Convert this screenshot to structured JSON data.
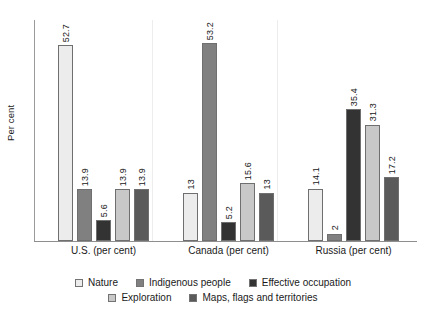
{
  "chart_data": {
    "type": "bar",
    "title": "",
    "subtitle": "",
    "xlabel": "",
    "ylabel": "Per cent",
    "ylim": [
      0,
      60
    ],
    "grid": false,
    "legend_position": "bottom",
    "orientation": "vertical",
    "grouping": "grouped",
    "value_labels_rotated": true,
    "categories": [
      "U.S. (per cent)",
      "Canada (per cent)",
      "Russia (per cent)"
    ],
    "series": [
      {
        "name": "Nature",
        "color": "#ECECEC",
        "values": [
          52.7,
          13,
          14.1
        ],
        "labels": [
          "52.7",
          "13",
          "14.1"
        ]
      },
      {
        "name": "Indigenous people",
        "color": "#808080",
        "values": [
          13.9,
          53.2,
          2
        ],
        "labels": [
          "13.9",
          "53.2",
          "2"
        ]
      },
      {
        "name": "Effective occupation",
        "color": "#333333",
        "values": [
          5.6,
          5.2,
          35.4
        ],
        "labels": [
          "5.6",
          "5.2",
          "35.4"
        ]
      },
      {
        "name": "Exploration",
        "color": "#C8C8C8",
        "values": [
          13.9,
          15.6,
          31.3
        ],
        "labels": [
          "13.9",
          "15.6",
          "31.3"
        ]
      },
      {
        "name": "Maps, flags and territories",
        "color": "#5A5A5A",
        "values": [
          13.9,
          13,
          17.2
        ],
        "labels": [
          "13.9",
          "13",
          "17.2"
        ]
      }
    ]
  },
  "axis": {
    "y_title": "Per cent"
  },
  "legend": {
    "rows": [
      [
        "Nature",
        "Indigenous people",
        "Effective occupation"
      ],
      [
        "Exploration",
        "Maps, flags and territories"
      ]
    ]
  },
  "colors": {
    "nature": "#ECECEC",
    "indigenous_people": "#808080",
    "effective_occupation": "#333333",
    "exploration": "#C8C8C8",
    "maps_flags_territories": "#5A5A5A",
    "axis": "#8e8e8e",
    "separator": "#ededed",
    "text": "#1a1a1a"
  }
}
